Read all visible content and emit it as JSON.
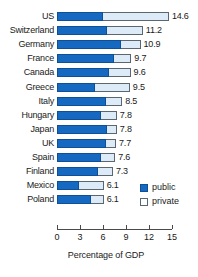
{
  "chart_data": {
    "type": "bar",
    "orientation": "horizontal",
    "stacked": true,
    "title": "",
    "xlabel": "Percentage of GDP",
    "ylabel": "",
    "xlim": [
      0,
      15
    ],
    "xticks": [
      0,
      3,
      6,
      9,
      12,
      15
    ],
    "xtick_labels": [
      "0",
      "3",
      "6",
      "9",
      "12",
      "15"
    ],
    "grid": false,
    "legend_position": "right-bottom",
    "categories": [
      "US",
      "Switzerland",
      "Germany",
      "France",
      "Canada",
      "Greece",
      "Italy",
      "Hungary",
      "Japan",
      "UK",
      "Spain",
      "Finland",
      "Mexico",
      "Poland"
    ],
    "totals": [
      14.6,
      11.2,
      10.9,
      9.7,
      9.6,
      9.5,
      8.5,
      7.8,
      7.8,
      7.7,
      7.6,
      7.3,
      6.1,
      6.1
    ],
    "value_labels": [
      "14.6",
      "11.2",
      "10.9",
      "9.7",
      "9.6",
      "9.5",
      "8.5",
      "7.8",
      "7.8",
      "7.7",
      "7.6",
      "7.3",
      "6.1",
      "6.1"
    ],
    "series": [
      {
        "name": "public",
        "color": "#1569c0",
        "values": [
          6.0,
          6.5,
          8.4,
          7.4,
          6.8,
          5.0,
          6.4,
          5.8,
          6.5,
          6.4,
          5.7,
          5.4,
          2.9,
          4.4
        ]
      },
      {
        "name": "private",
        "color": "#dcebf7",
        "values": [
          8.6,
          4.7,
          2.5,
          2.3,
          2.8,
          4.5,
          2.1,
          2.0,
          1.3,
          1.3,
          1.9,
          1.9,
          3.2,
          1.7
        ]
      }
    ]
  },
  "legend": {
    "items": [
      {
        "label": "public",
        "key": "public"
      },
      {
        "label": "private",
        "key": "private"
      }
    ]
  }
}
